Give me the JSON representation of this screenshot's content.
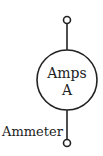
{
  "diagram": {
    "type": "circuit-symbol",
    "component": "ammeter",
    "symbol_text_line1": "Amps",
    "symbol_text_line2": "A",
    "label": "Ammeter",
    "stroke_color": "#222222",
    "background": "#ffffff"
  }
}
